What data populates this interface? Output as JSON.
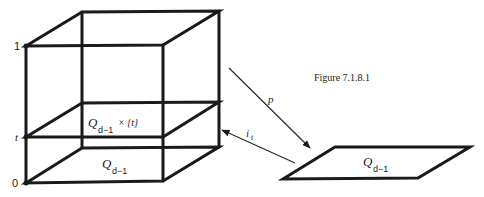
{
  "figure": {
    "caption": "Figure 7.1.8.1",
    "axis_labels": {
      "top": "1",
      "middle": "t",
      "bottom": "0"
    },
    "cube": {
      "slice_label_base": "Q",
      "slice_label_sub": "d−1",
      "slice_label_suffix": "× {t}",
      "base_label_base": "Q",
      "base_label_sub": "d−1"
    },
    "target": {
      "label_base": "Q",
      "label_sub": "d−1"
    },
    "arrows": {
      "projection": {
        "label": "p"
      },
      "inclusion": {
        "label_base": "i",
        "label_sub": "t"
      }
    }
  }
}
